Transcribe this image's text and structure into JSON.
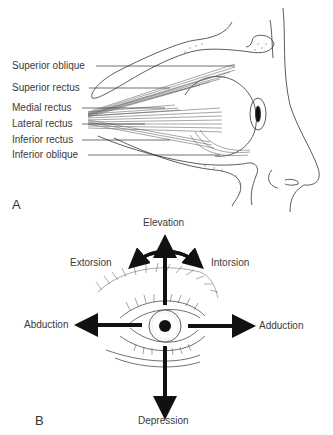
{
  "panel_a": {
    "letter": "A",
    "muscle_labels": [
      "Superior oblique",
      "Superior rectus",
      "Medial rectus",
      "Lateral rectus",
      "Inferior rectus",
      "Inferior oblique"
    ]
  },
  "panel_b": {
    "letter": "B",
    "directions": {
      "up": "Elevation",
      "down": "Depression",
      "left": "Abduction",
      "right": "Adduction",
      "arc_left": "Extorsion",
      "arc_right": "Intorsion"
    }
  },
  "colors": {
    "ink": "#1a1a1a",
    "label_text": "#3a3a3a",
    "muscle": "#6a6a6a"
  }
}
